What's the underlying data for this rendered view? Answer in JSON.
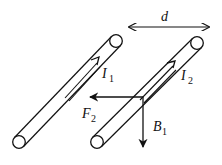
{
  "diagram": {
    "colors": {
      "stroke": "#111111",
      "background": "#ffffff"
    },
    "labels": {
      "distance": "d",
      "current1": {
        "main": "I",
        "sub": "1"
      },
      "current2": {
        "main": "I",
        "sub": "2"
      },
      "force": {
        "main": "F",
        "sub": "2"
      },
      "field": {
        "main": "B",
        "sub": "1"
      }
    },
    "elements": [
      {
        "id": "wire-1",
        "type": "cylinder-wire",
        "from": [
          19,
          142
        ],
        "to": [
          116,
          41
        ],
        "current_direction": "up-right"
      },
      {
        "id": "wire-2",
        "type": "cylinder-wire",
        "from": [
          97,
          142
        ],
        "to": [
          197,
          43
        ],
        "current_direction": "up-right"
      },
      {
        "id": "distance-arrow",
        "type": "double-arrow",
        "from": [
          128,
          27
        ],
        "to": [
          210,
          27
        ],
        "label": "d"
      },
      {
        "id": "force-arrow",
        "type": "arrow",
        "from": [
          143,
          97
        ],
        "to": [
          89,
          97
        ],
        "label": "F2",
        "direction": "left"
      },
      {
        "id": "field-arrow",
        "type": "arrow",
        "from": [
          143,
          97
        ],
        "to": [
          143,
          147
        ],
        "label": "B1",
        "direction": "down"
      }
    ]
  }
}
